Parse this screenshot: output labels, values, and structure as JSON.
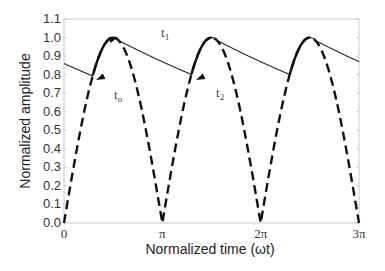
{
  "chart_data": {
    "type": "line",
    "title": "",
    "xlabel": "Normalized time (ωt)",
    "ylabel": "Normalized amplitude",
    "xlim": [
      0,
      3
    ],
    "xlim_units": "π",
    "ylim": [
      0.0,
      1.1
    ],
    "x_ticks": [
      {
        "value": 0,
        "label": "0"
      },
      {
        "value": 1,
        "label": "π"
      },
      {
        "value": 2,
        "label": "2π"
      },
      {
        "value": 3,
        "label": "3π"
      }
    ],
    "y_ticks": [
      "0.0",
      "0.1",
      "0.2",
      "0.3",
      "0.4",
      "0.5",
      "0.6",
      "0.7",
      "0.8",
      "0.9",
      "1.0",
      "1.1"
    ],
    "grid": false,
    "legend": null,
    "series": [
      {
        "name": "Rectified sine |sin(ωt)|",
        "style": "dashed",
        "x_pi": [
          0,
          0.25,
          0.5,
          0.75,
          1.0,
          1.25,
          1.5,
          1.75,
          2.0,
          2.25,
          2.5,
          2.75,
          3.0
        ],
        "values": [
          0.0,
          0.71,
          1.0,
          0.71,
          0.0,
          0.71,
          1.0,
          0.71,
          0.0,
          0.71,
          1.0,
          0.71,
          0.0
        ]
      },
      {
        "name": "Capacitor output (ripple)",
        "style": "solid",
        "x_pi": [
          0,
          0.29,
          0.5,
          1.3,
          1.5,
          2.3,
          2.5,
          3.0
        ],
        "values": [
          0.86,
          0.79,
          1.0,
          0.8,
          1.0,
          0.8,
          1.0,
          0.87
        ]
      }
    ],
    "annotations": [
      {
        "label": "t₁",
        "x_pi": 0.98,
        "y": 1.04,
        "meaning": "discharge interval"
      },
      {
        "label": "t₀",
        "x_pi": 0.42,
        "y": 0.7
      },
      {
        "label": "t₂",
        "x_pi": 1.5,
        "y": 0.72
      }
    ]
  },
  "labels": {
    "xlabel": "Normalized time (ωt)",
    "ylabel": "Normalized amplitude",
    "t1": "t",
    "t1_sub": "1",
    "t0": "t",
    "t0_sub": "o",
    "t2": "t",
    "t2_sub": "2"
  }
}
